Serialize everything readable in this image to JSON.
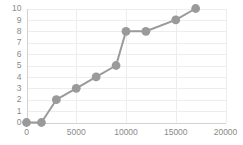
{
  "chart_data": {
    "type": "line",
    "title": "",
    "subtitle": "",
    "xlabel": "",
    "ylabel": "",
    "x": [
      0,
      1500,
      3000,
      5000,
      7000,
      9000,
      10000,
      12000,
      15000,
      17000
    ],
    "values": [
      0,
      0,
      2,
      3,
      4,
      5,
      8,
      8,
      9,
      10
    ],
    "series": [
      {
        "name": "",
        "x": [
          0,
          1500,
          3000,
          5000,
          7000,
          9000,
          10000,
          12000,
          15000,
          17000
        ],
        "values": [
          0,
          0,
          2,
          3,
          4,
          5,
          8,
          8,
          9,
          10
        ]
      }
    ],
    "xlim": [
      0,
      20000
    ],
    "ylim": [
      0,
      10
    ],
    "xticks": [
      0,
      5000,
      10000,
      15000,
      20000
    ],
    "xtick_labels": [
      "0",
      "5000",
      "10000",
      "15000",
      "20000"
    ],
    "yticks": [
      0,
      1,
      2,
      3,
      4,
      5,
      6,
      7,
      8,
      9,
      10
    ],
    "ytick_labels": [
      "0",
      "1",
      "2",
      "3",
      "4",
      "5",
      "6",
      "7",
      "8",
      "9",
      "10"
    ],
    "grid": true,
    "grid_x": true,
    "grid_y": true,
    "legend": false,
    "legend_position": "none",
    "markers": true,
    "annotations": []
  },
  "style": {
    "background_color": "#ffffff",
    "series_color": "#9a9a9a",
    "marker_color": "#9a9a9a",
    "grid_color": "#ededed",
    "axis_color": "#d2d2d2",
    "tick_label_color": "#8a8a8a"
  }
}
